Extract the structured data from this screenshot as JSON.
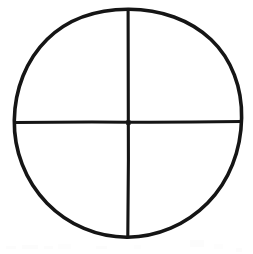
{
  "figure": {
    "kind": "line-drawing",
    "name": "quartered-circle",
    "title": "Quartered circle",
    "background_color": "#ffffff",
    "ink_color": "#151515",
    "canvas": {
      "width": 253,
      "height": 254
    },
    "circle": {
      "label": "circle-outline",
      "center_x": 128,
      "center_y": 123,
      "radius_x": 114,
      "radius_y": 114,
      "stroke_width": 3.6,
      "fill": "none"
    },
    "vertical_diameter": {
      "label": "vertical-diameter",
      "x": 128,
      "y_start": 9,
      "y_end": 237,
      "stroke_width": 3.1,
      "orientation": "vertical"
    },
    "horizontal_diameter": {
      "label": "horizontal-diameter",
      "y": 122,
      "x_start": 14,
      "x_end": 241,
      "stroke_width": 3.0,
      "orientation": "horizontal"
    },
    "center_point": {
      "label": "center-intersection",
      "x": 128,
      "y": 122
    },
    "quadrants": [
      {
        "label": "upper-left-quadrant"
      },
      {
        "label": "upper-right-quadrant"
      },
      {
        "label": "lower-left-quadrant"
      },
      {
        "label": "lower-right-quadrant"
      }
    ],
    "scan_artifacts": {
      "label": "faint-scan-noise",
      "present": true,
      "region": "bottom edge",
      "color": "#fbfbfb"
    }
  }
}
